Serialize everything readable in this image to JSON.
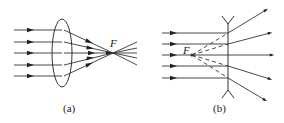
{
  "figures": [
    {
      "id": "a",
      "caption": "(a)",
      "lens_type": "convex",
      "focus_label": "F",
      "incoming_rays": 5
    },
    {
      "id": "b",
      "caption": "(b)",
      "lens_type": "concave",
      "focus_label": "F",
      "incoming_rays": 5
    }
  ],
  "colors": {
    "line": "#333333",
    "background": "#ffffff"
  }
}
